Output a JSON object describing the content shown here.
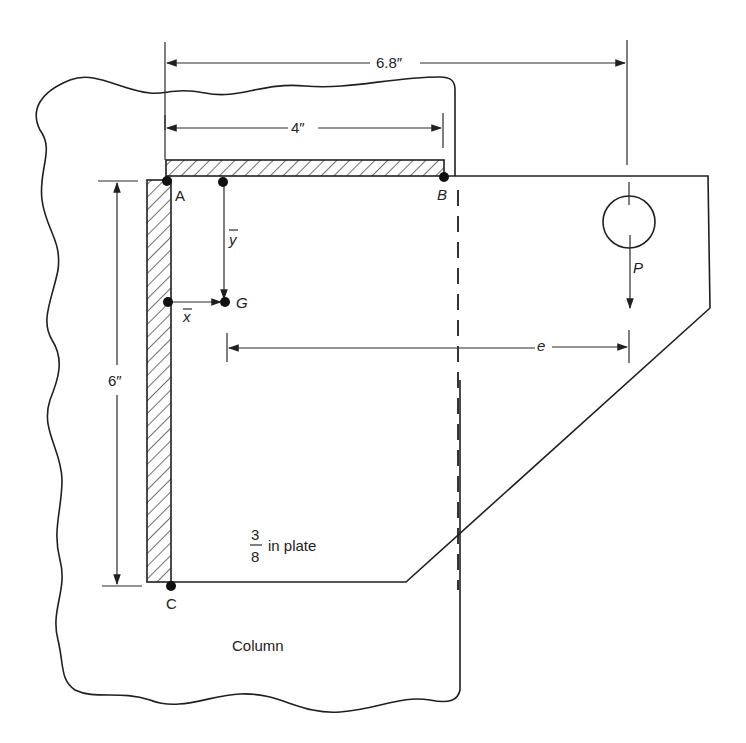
{
  "diagram": {
    "dimensions": {
      "overall_width": "6.8″",
      "weld_top_length": "4″",
      "weld_vertical_length": "6″",
      "eccentricity": "e"
    },
    "points": {
      "A": "A",
      "B": "B",
      "C": "C",
      "G": "G"
    },
    "centroid_labels": {
      "x_bar": "x",
      "y_bar": "y"
    },
    "load": {
      "label": "P"
    },
    "plate": {
      "fraction_num": "3",
      "fraction_den": "8",
      "text": "in plate"
    },
    "column_label": "Column",
    "colors": {
      "line": "#1f1f1f",
      "background": "#ffffff"
    }
  }
}
